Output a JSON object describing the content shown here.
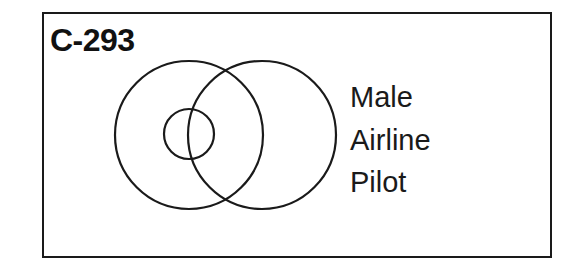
{
  "figure": {
    "id_label": "C-293",
    "labels": [
      "Male",
      "Airline",
      "Pilot"
    ],
    "colors": {
      "stroke": "#1a1a1a",
      "background": "#ffffff"
    },
    "circles": [
      {
        "name": "large-left",
        "cx": 189,
        "cy": 135,
        "r": 74
      },
      {
        "name": "large-right",
        "cx": 262,
        "cy": 135,
        "r": 74
      },
      {
        "name": "small-inner",
        "cx": 189,
        "cy": 134,
        "r": 25
      }
    ]
  }
}
